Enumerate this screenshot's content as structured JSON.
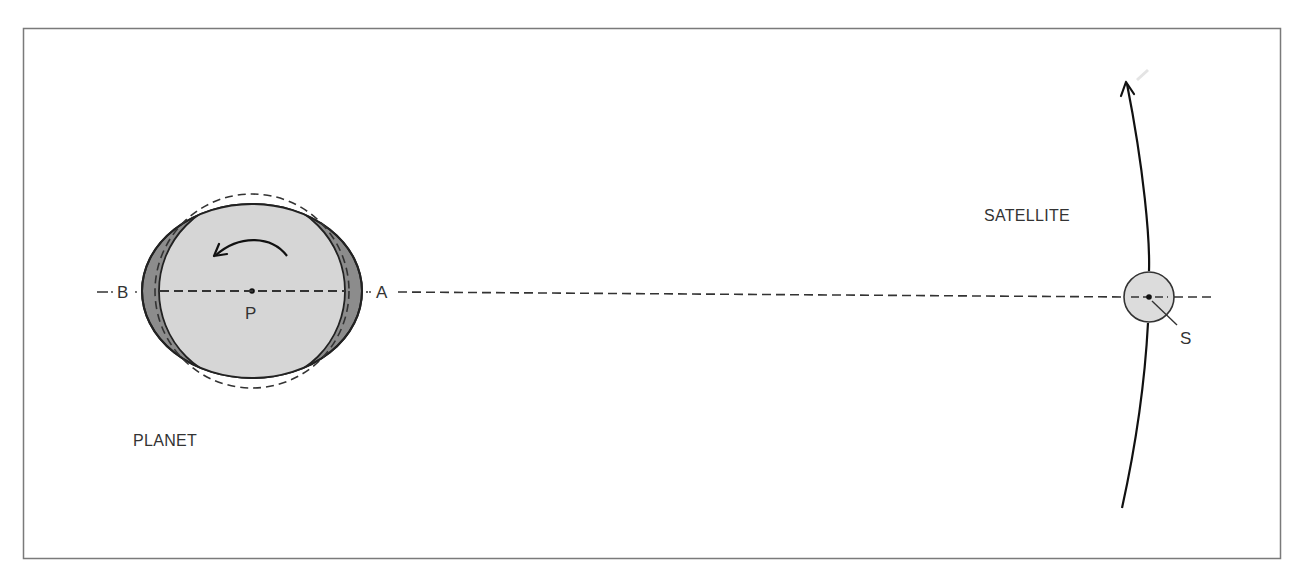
{
  "diagram": {
    "type": "tidal-bulge-schematic",
    "labels": {
      "planet": "PLANET",
      "satellite": "SATELLITE",
      "point_a": "A",
      "point_b": "B",
      "center_p": "P",
      "center_s": "S"
    },
    "colors": {
      "frame": "#7a7a7a",
      "line": "#222222",
      "planet_fill": "#d6d6d6",
      "bulge_fill": "#8c8c8c",
      "satellite_fill": "#dcdcdc",
      "text": "#333333"
    },
    "elements": {
      "planet_center": [
        252,
        291
      ],
      "planet_bulge_ellipse": {
        "rx": 110,
        "ry": 87
      },
      "planet_inner_circle_r": 93,
      "planet_undeformed_dashed_circle_r": 97,
      "rotation_arrow": "counter-clockwise",
      "satellite_center": [
        1149,
        297
      ],
      "satellite_radius": 25,
      "orbit_direction": "upward",
      "axis_line": "dashed, through B, P, A, S"
    }
  }
}
